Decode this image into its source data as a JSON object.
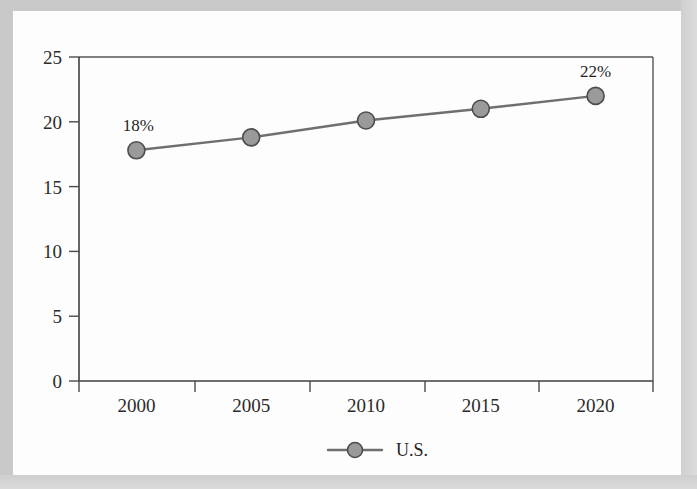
{
  "figure": {
    "background_color": "#fdfdfd",
    "frame_color": "#c9c9c9",
    "plot_border_color": "#4a4a4a"
  },
  "chart_data": {
    "type": "line",
    "title": "",
    "subtitle": "",
    "xlabel": "",
    "ylabel": "",
    "x": [
      2000,
      2005,
      2010,
      2015,
      2020
    ],
    "categories": [
      "2000",
      "2005",
      "2010",
      "2015",
      "2020"
    ],
    "series": [
      {
        "name": "U.S.",
        "values": [
          17.8,
          18.8,
          20.1,
          21.0,
          22.0
        ],
        "line_color": "#6f6f6f",
        "marker_color": "#9a9a9a",
        "marker_edge_color": "#4d4d4d",
        "marker": "circle"
      }
    ],
    "xlim": [
      1998.2,
      2021.8
    ],
    "ylim": [
      0,
      25
    ],
    "yticks": [
      0,
      5,
      10,
      15,
      20,
      25
    ],
    "ytick_labels": [
      "0",
      "5",
      "10",
      "15",
      "20",
      "25"
    ],
    "xtick_labels": [
      "2000",
      "2005",
      "2010",
      "2015",
      "2020"
    ],
    "grid": false,
    "legend_position": "bottom-center",
    "legend_entries": [
      "U.S."
    ],
    "annotations": [
      {
        "text": "18%",
        "x": 2000,
        "y": 17.8,
        "position": "above"
      },
      {
        "text": "22%",
        "x": 2020,
        "y": 22.0,
        "position": "above"
      }
    ]
  },
  "axis": {
    "y_ticks": [
      {
        "label": "25",
        "value": 25
      },
      {
        "label": "20",
        "value": 20
      },
      {
        "label": "15",
        "value": 15
      },
      {
        "label": "10",
        "value": 10
      },
      {
        "label": "5",
        "value": 5
      },
      {
        "label": "0",
        "value": 0
      }
    ],
    "x_ticks": [
      {
        "label": "2000",
        "value": 2000
      },
      {
        "label": "2005",
        "value": 2005
      },
      {
        "label": "2010",
        "value": 2010
      },
      {
        "label": "2015",
        "value": 2015
      },
      {
        "label": "2020",
        "value": 2020
      }
    ]
  },
  "legend": {
    "items": [
      {
        "label": "U.S.",
        "marker_color": "#9a9a9a",
        "line_color": "#6f6f6f"
      }
    ]
  }
}
